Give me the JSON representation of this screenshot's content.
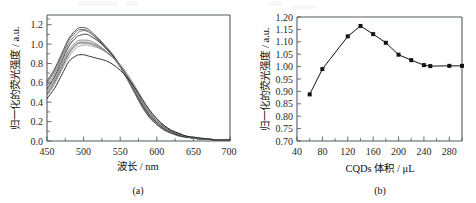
{
  "figure": {
    "background": "#ffffff",
    "line_color": "#121212",
    "axis_color": "#555a5e"
  },
  "panel_a": {
    "caption": "(a)",
    "xlabel": "波长 / nm",
    "ylabel": "归一化的荧光强度 / a.u.",
    "xticks": [
      "450",
      "500",
      "550",
      "600",
      "650",
      "700"
    ],
    "yticks": [
      "0.0",
      "0.2",
      "0.4",
      "0.6",
      "0.8",
      "1.0",
      "1.2"
    ]
  },
  "panel_b": {
    "caption": "(b)",
    "xlabel": "CQDs 体积 / μL",
    "ylabel": "归一化的荧光强度 / a.u.",
    "xticks": [
      "40",
      "80",
      "120",
      "160",
      "200",
      "240",
      "280"
    ],
    "yticks": [
      "0.70",
      "0.75",
      "0.80",
      "0.85",
      "0.90",
      "0.95",
      "1.00",
      "1.05",
      "1.10",
      "1.15",
      "1.20"
    ]
  },
  "chart_data": [
    {
      "type": "line",
      "panel": "(a)",
      "title": "",
      "xlabel": "波长 / nm",
      "ylabel": "归一化的荧光强度 / a.u.",
      "xlim": [
        450,
        700
      ],
      "ylim": [
        0.0,
        1.3
      ],
      "xticks": [
        450,
        500,
        550,
        600,
        650,
        700
      ],
      "yticks": [
        0.0,
        0.2,
        0.4,
        0.6,
        0.8,
        1.0,
        1.2
      ],
      "grid": false,
      "legend": "none",
      "x": [
        450,
        460,
        470,
        480,
        490,
        495,
        500,
        505,
        510,
        520,
        530,
        540,
        550,
        560,
        570,
        580,
        590,
        600,
        610,
        620,
        630,
        640,
        650,
        660,
        670,
        680,
        690,
        700
      ],
      "series": [
        {
          "name": "curve-1",
          "color": "#3f3f3f",
          "values": [
            0.62,
            0.74,
            0.9,
            1.06,
            1.15,
            1.17,
            1.17,
            1.16,
            1.13,
            1.06,
            0.98,
            0.89,
            0.78,
            0.65,
            0.5,
            0.36,
            0.25,
            0.17,
            0.12,
            0.08,
            0.06,
            0.04,
            0.03,
            0.02,
            0.02,
            0.01,
            0.01,
            0.01
          ]
        },
        {
          "name": "curve-2",
          "color": "#555555",
          "values": [
            0.6,
            0.72,
            0.88,
            1.04,
            1.13,
            1.15,
            1.15,
            1.14,
            1.11,
            1.04,
            0.96,
            0.87,
            0.76,
            0.63,
            0.49,
            0.35,
            0.24,
            0.17,
            0.11,
            0.08,
            0.05,
            0.04,
            0.03,
            0.02,
            0.02,
            0.01,
            0.01,
            0.01
          ]
        },
        {
          "name": "curve-3",
          "color": "#6a6a6a",
          "values": [
            0.57,
            0.69,
            0.85,
            1.01,
            1.1,
            1.13,
            1.14,
            1.13,
            1.11,
            1.05,
            0.97,
            0.88,
            0.78,
            0.65,
            0.51,
            0.37,
            0.26,
            0.18,
            0.12,
            0.08,
            0.06,
            0.04,
            0.03,
            0.02,
            0.02,
            0.01,
            0.01,
            0.01
          ]
        },
        {
          "name": "curve-4",
          "color": "#2b2b2b",
          "values": [
            0.54,
            0.66,
            0.82,
            0.98,
            1.07,
            1.09,
            1.1,
            1.1,
            1.08,
            1.03,
            0.96,
            0.88,
            0.78,
            0.66,
            0.52,
            0.38,
            0.27,
            0.19,
            0.13,
            0.09,
            0.06,
            0.04,
            0.03,
            0.02,
            0.02,
            0.01,
            0.01,
            0.01
          ]
        },
        {
          "name": "curve-5",
          "color": "#787878",
          "values": [
            0.52,
            0.64,
            0.79,
            0.94,
            1.02,
            1.04,
            1.04,
            1.04,
            1.03,
            0.99,
            0.93,
            0.86,
            0.77,
            0.65,
            0.52,
            0.39,
            0.28,
            0.2,
            0.14,
            0.1,
            0.07,
            0.05,
            0.03,
            0.02,
            0.02,
            0.01,
            0.01,
            0.01
          ]
        },
        {
          "name": "curve-6",
          "color": "#8a8a8a",
          "values": [
            0.5,
            0.62,
            0.77,
            0.92,
            1.0,
            1.02,
            1.02,
            1.02,
            1.01,
            0.98,
            0.93,
            0.86,
            0.77,
            0.66,
            0.53,
            0.4,
            0.29,
            0.21,
            0.14,
            0.1,
            0.07,
            0.05,
            0.03,
            0.02,
            0.02,
            0.01,
            0.01,
            0.01
          ]
        },
        {
          "name": "curve-7",
          "color": "#5f5f5f",
          "values": [
            0.48,
            0.6,
            0.75,
            0.9,
            0.99,
            1.01,
            1.01,
            1.01,
            1.0,
            0.97,
            0.92,
            0.86,
            0.78,
            0.67,
            0.55,
            0.41,
            0.3,
            0.21,
            0.15,
            0.1,
            0.07,
            0.05,
            0.03,
            0.02,
            0.02,
            0.01,
            0.01,
            0.01
          ]
        },
        {
          "name": "curve-8",
          "color": "#999999",
          "values": [
            0.47,
            0.58,
            0.73,
            0.87,
            0.96,
            0.98,
            0.99,
            0.99,
            0.98,
            0.96,
            0.92,
            0.86,
            0.79,
            0.69,
            0.57,
            0.44,
            0.32,
            0.23,
            0.16,
            0.11,
            0.08,
            0.05,
            0.04,
            0.03,
            0.02,
            0.01,
            0.01,
            0.01
          ]
        },
        {
          "name": "curve-9",
          "color": "#1a1a1a",
          "values": [
            0.44,
            0.54,
            0.68,
            0.82,
            0.88,
            0.89,
            0.89,
            0.88,
            0.87,
            0.85,
            0.83,
            0.79,
            0.73,
            0.65,
            0.55,
            0.43,
            0.32,
            0.23,
            0.16,
            0.11,
            0.08,
            0.05,
            0.04,
            0.03,
            0.02,
            0.01,
            0.01,
            0.01
          ]
        }
      ]
    },
    {
      "type": "line",
      "panel": "(b)",
      "title": "",
      "xlabel": "CQDs 体积 / μL",
      "ylabel": "归一化的荧光强度 / a.u.",
      "xlim": [
        40,
        300
      ],
      "ylim": [
        0.7,
        1.2
      ],
      "xticks": [
        40,
        80,
        120,
        160,
        200,
        240,
        280
      ],
      "grid": false,
      "legend": "none",
      "marker": "square",
      "x": [
        60,
        80,
        120,
        140,
        160,
        180,
        200,
        220,
        240,
        250,
        280,
        300
      ],
      "values": [
        0.888,
        0.99,
        1.122,
        1.164,
        1.131,
        1.096,
        1.048,
        1.026,
        1.006,
        1.002,
        1.003,
        1.003
      ]
    }
  ]
}
